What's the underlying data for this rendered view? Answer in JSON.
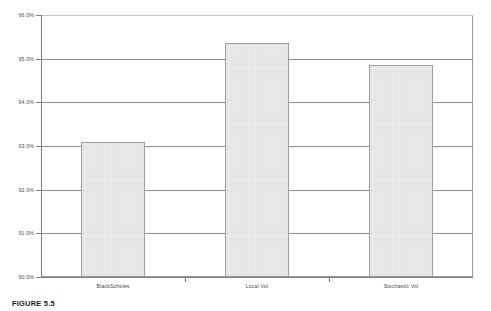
{
  "figure": {
    "caption_label": "FIGURE 5.5",
    "caption_text": ""
  },
  "chart_data": {
    "type": "bar",
    "title": "",
    "subtitle": "",
    "xlabel": "",
    "ylabel": "",
    "categories": [
      "BlackScholes",
      "Local Vol",
      "Stochastic Vol"
    ],
    "values": [
      93.1,
      95.35,
      94.85
    ],
    "value_labels": [
      "93.1%",
      "95.35%",
      "94.85%"
    ],
    "series": [
      {
        "name": "",
        "values": [
          93.1,
          95.35,
          94.85
        ]
      }
    ],
    "ylim": [
      90.0,
      96.0
    ],
    "ytick_values": [
      90.0,
      91.0,
      92.0,
      93.0,
      94.0,
      95.0,
      96.0
    ],
    "ytick_labels": [
      "90.0%",
      "91.0%",
      "92.0%",
      "93.0%",
      "94.0%",
      "95.0%",
      "96.0%"
    ],
    "grid": true,
    "grid_axis": "y",
    "legend": false,
    "legend_position": "none",
    "bar_fill_color": "#e9e9e9",
    "bar_border_color": "#9d9d9d",
    "gridline_color": "#8e8e8e",
    "axis_color": "#7d7d7d",
    "plot_background": "#ffffff",
    "text_color": "#4a4a4a"
  }
}
